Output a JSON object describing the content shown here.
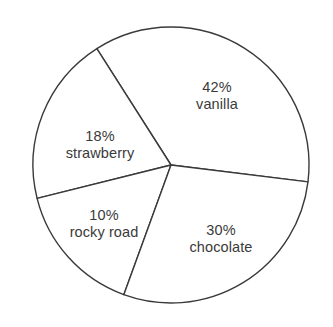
{
  "chart_data": {
    "type": "pie",
    "title": "",
    "subtitle": "",
    "xlabel": "",
    "ylabel": "",
    "legend": "none",
    "grid": false,
    "units": "percent",
    "total": 100,
    "categories": [
      "vanilla",
      "chocolate",
      "strawberry",
      "rocky road"
    ],
    "values": [
      42,
      30,
      18,
      10
    ],
    "slices": [
      {
        "label": "vanilla",
        "value": 42,
        "percent_text": "42%",
        "start_angle_deg": -7,
        "end_angle_deg": 122.5,
        "fill": "#ffffff",
        "stroke": "#3a3a3a",
        "label_x": 217,
        "label_y": 96
      },
      {
        "label": "strawberry",
        "value": 18,
        "percent_text": "18%",
        "start_angle_deg": 122.5,
        "end_angle_deg": 194,
        "fill": "#ffffff",
        "stroke": "#3a3a3a",
        "label_x": 100,
        "label_y": 145
      },
      {
        "label": "rocky road",
        "value": 10,
        "percent_text": "10%",
        "start_angle_deg": 194,
        "end_angle_deg": 250,
        "fill": "#ffffff",
        "stroke": "#3a3a3a",
        "label_x": 104,
        "label_y": 224
      },
      {
        "label": "chocolate",
        "value": 30,
        "percent_text": "30%",
        "start_angle_deg": 250,
        "end_angle_deg": 353,
        "fill": "#ffffff",
        "stroke": "#3a3a3a",
        "label_x": 221,
        "label_y": 239
      }
    ],
    "geometry": {
      "center_x": 171,
      "center_y": 165,
      "radius": 138
    },
    "colors": {
      "background": "#ffffff",
      "stroke": "#3a3a3a",
      "text": "#3a3a3a"
    }
  }
}
